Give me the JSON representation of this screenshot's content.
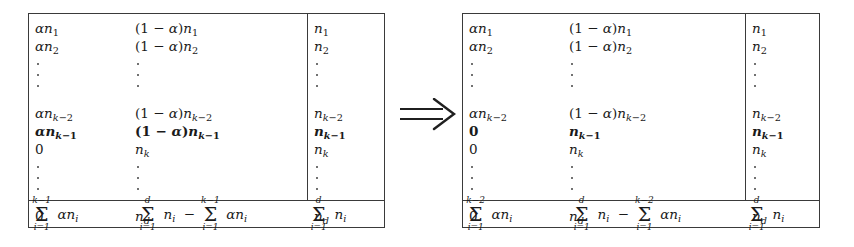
{
  "figure": {
    "type": "matrix-transformation-diagram",
    "operator": {
      "name": "implies-arrow",
      "glyph": "⟹",
      "meaning": "implies"
    },
    "colors": {
      "background": "#ffffff",
      "ink": "#1a1a1a",
      "rule": "#3a3a3a",
      "dots": "#555555"
    },
    "tables": [
      {
        "id": "left",
        "position": "before",
        "columns": 3,
        "rows": [
          {
            "kind": "entry",
            "cells": [
              "αn₁",
              "(1 − α)n₁",
              "n₁"
            ],
            "bold": false
          },
          {
            "kind": "entry",
            "cells": [
              "αn₂",
              "(1 − α)n₂",
              "n₂"
            ],
            "bold": false
          },
          {
            "kind": "vdots",
            "cells": [
              "⋮",
              "⋮",
              "⋮"
            ]
          },
          {
            "kind": "entry",
            "cells": [
              "αnₖ₋₂",
              "(1 − α)nₖ₋₂",
              "nₖ₋₂"
            ],
            "bold": false
          },
          {
            "kind": "entry",
            "cells": [
              "αnₖ₋₁",
              "(1 − α)nₖ₋₁",
              "nₖ₋₁"
            ],
            "bold": true
          },
          {
            "kind": "entry",
            "cells": [
              "0",
              "nₖ",
              "nₖ"
            ],
            "bold": false
          },
          {
            "kind": "vdots",
            "cells": [
              "⋮",
              "⋮",
              "⋮"
            ]
          },
          {
            "kind": "entry",
            "cells": [
              "0",
              "n_d",
              "n_d"
            ],
            "bold": false
          }
        ],
        "totals": {
          "col1": {
            "sum_upper": "k−1",
            "sum_lower": "i=1",
            "body": "αnᵢ"
          },
          "col2": {
            "first_upper": "d",
            "first_lower": "i=1",
            "first_body": "nᵢ",
            "operator": "−",
            "second_upper": "k−1",
            "second_lower": "i=1",
            "second_body": "αnᵢ"
          },
          "col3": {
            "sum_upper": "d",
            "sum_lower": "i=1",
            "body": "nᵢ"
          }
        }
      },
      {
        "id": "right",
        "position": "after",
        "columns": 3,
        "rows": [
          {
            "kind": "entry",
            "cells": [
              "αn₁",
              "(1 − α)n₁",
              "n₁"
            ],
            "bold": false
          },
          {
            "kind": "entry",
            "cells": [
              "αn₂",
              "(1 − α)n₂",
              "n₂"
            ],
            "bold": false
          },
          {
            "kind": "vdots",
            "cells": [
              "⋮",
              "⋮",
              "⋮"
            ]
          },
          {
            "kind": "entry",
            "cells": [
              "αnₖ₋₂",
              "(1 − α)nₖ₋₂",
              "nₖ₋₂"
            ],
            "bold": false
          },
          {
            "kind": "entry",
            "cells": [
              "0",
              "nₖ₋₁",
              "nₖ₋₁"
            ],
            "bold": true
          },
          {
            "kind": "entry",
            "cells": [
              "0",
              "nₖ",
              "nₖ"
            ],
            "bold": false
          },
          {
            "kind": "vdots",
            "cells": [
              "⋮",
              "⋮",
              "⋮"
            ]
          },
          {
            "kind": "entry",
            "cells": [
              "0",
              "n_d",
              "n_d"
            ],
            "bold": false
          }
        ],
        "totals": {
          "col1": {
            "sum_upper": "k−2",
            "sum_lower": "i=1",
            "body": "αnᵢ"
          },
          "col2": {
            "first_upper": "d",
            "first_lower": "i=1",
            "first_body": "nᵢ",
            "operator": "−",
            "second_upper": "k−2",
            "second_lower": "i=1",
            "second_body": "αnᵢ"
          },
          "col3": {
            "sum_upper": "d",
            "sum_lower": "i=1",
            "body": "nᵢ"
          }
        }
      }
    ],
    "symbols": {
      "alpha": "α",
      "one_minus_alpha": "(1 − α)",
      "sigma": "∑",
      "minus": "−",
      "zero": "0",
      "n": "n",
      "k": "k",
      "d": "d",
      "i_eq_1": "i=1",
      "k_minus_1": "k−1",
      "k_minus_2": "k−2"
    }
  }
}
